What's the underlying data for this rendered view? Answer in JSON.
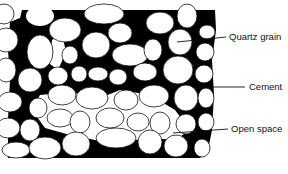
{
  "diagram": {
    "colors": {
      "cement": "#000000",
      "grain": "#ffffff",
      "open_space": "#ffffff",
      "outline": "#111111",
      "background": "#ffffff"
    },
    "labels": [
      {
        "id": "quartz-grain",
        "text": "Quartz grain"
      },
      {
        "id": "cement",
        "text": "Cement"
      },
      {
        "id": "open-space",
        "text": "Open space"
      }
    ]
  }
}
